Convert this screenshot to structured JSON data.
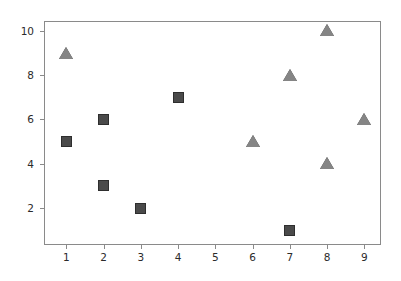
{
  "chart_data": {
    "type": "scatter",
    "title": "",
    "subtitle": "",
    "xlabel": "",
    "ylabel": "",
    "xlim": [
      0.4,
      9.45
    ],
    "ylim": [
      0.33,
      10.45
    ],
    "grid": false,
    "legend": null,
    "xticks": [
      1,
      2,
      3,
      4,
      5,
      6,
      7,
      8,
      9
    ],
    "xticklabels": [
      "1",
      "2",
      "3",
      "4",
      "5",
      "6",
      "7",
      "8",
      "9"
    ],
    "yticks": [
      2,
      4,
      6,
      8,
      10
    ],
    "yticklabels": [
      "2",
      "4",
      "6",
      "8",
      "10"
    ],
    "series": [
      {
        "name": "squares",
        "marker": "square",
        "color": "#4a4a4a",
        "edgecolor": "#2e2e2e",
        "points": [
          {
            "x": 1,
            "y": 5
          },
          {
            "x": 2,
            "y": 6
          },
          {
            "x": 2,
            "y": 3
          },
          {
            "x": 3,
            "y": 2
          },
          {
            "x": 4,
            "y": 7
          },
          {
            "x": 7,
            "y": 1
          }
        ]
      },
      {
        "name": "triangles",
        "marker": "triangle-up",
        "color": "#858585",
        "edgecolor": "#3d3d3d",
        "points": [
          {
            "x": 1,
            "y": 9
          },
          {
            "x": 6,
            "y": 5
          },
          {
            "x": 7,
            "y": 8
          },
          {
            "x": 8,
            "y": 10
          },
          {
            "x": 8,
            "y": 4
          },
          {
            "x": 9,
            "y": 6
          }
        ]
      }
    ]
  },
  "figure": {
    "background_color": "#ffffff",
    "axes_color": "#8a8a8a",
    "tick_label_color": "#2b2b2b"
  }
}
